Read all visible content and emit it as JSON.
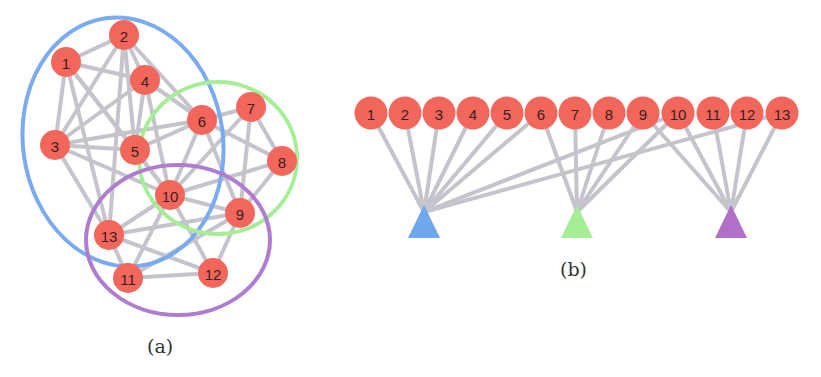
{
  "figure": {
    "panel_a": {
      "caption": "(a)",
      "nodes": [
        {
          "id": "1",
          "x": 66,
          "y": 62
        },
        {
          "id": "2",
          "x": 124,
          "y": 35
        },
        {
          "id": "3",
          "x": 55,
          "y": 145
        },
        {
          "id": "4",
          "x": 145,
          "y": 80
        },
        {
          "id": "5",
          "x": 135,
          "y": 150
        },
        {
          "id": "6",
          "x": 202,
          "y": 120
        },
        {
          "id": "7",
          "x": 251,
          "y": 107
        },
        {
          "id": "8",
          "x": 282,
          "y": 161
        },
        {
          "id": "9",
          "x": 240,
          "y": 213
        },
        {
          "id": "10",
          "x": 170,
          "y": 195
        },
        {
          "id": "11",
          "x": 128,
          "y": 278
        },
        {
          "id": "12",
          "x": 213,
          "y": 273
        },
        {
          "id": "13",
          "x": 109,
          "y": 235
        }
      ],
      "edges": [
        [
          "1",
          "2"
        ],
        [
          "1",
          "3"
        ],
        [
          "1",
          "4"
        ],
        [
          "1",
          "5"
        ],
        [
          "1",
          "13"
        ],
        [
          "1",
          "10"
        ],
        [
          "2",
          "3"
        ],
        [
          "2",
          "4"
        ],
        [
          "2",
          "5"
        ],
        [
          "2",
          "6"
        ],
        [
          "2",
          "13"
        ],
        [
          "3",
          "4"
        ],
        [
          "3",
          "5"
        ],
        [
          "3",
          "6"
        ],
        [
          "3",
          "10"
        ],
        [
          "3",
          "13"
        ],
        [
          "4",
          "5"
        ],
        [
          "4",
          "6"
        ],
        [
          "4",
          "10"
        ],
        [
          "5",
          "6"
        ],
        [
          "5",
          "10"
        ],
        [
          "6",
          "7"
        ],
        [
          "6",
          "9"
        ],
        [
          "6",
          "10"
        ],
        [
          "6",
          "8"
        ],
        [
          "7",
          "8"
        ],
        [
          "7",
          "9"
        ],
        [
          "7",
          "10"
        ],
        [
          "8",
          "9"
        ],
        [
          "8",
          "10"
        ],
        [
          "9",
          "10"
        ],
        [
          "9",
          "12"
        ],
        [
          "9",
          "13"
        ],
        [
          "9",
          "11"
        ],
        [
          "10",
          "11"
        ],
        [
          "10",
          "12"
        ],
        [
          "10",
          "13"
        ],
        [
          "11",
          "12"
        ],
        [
          "11",
          "13"
        ],
        [
          "12",
          "13"
        ]
      ],
      "communities": [
        {
          "name": "blue",
          "color": "#7aabf0",
          "cx": 123,
          "cy": 142,
          "rx": 100,
          "ry": 125,
          "rotate": -8
        },
        {
          "name": "green",
          "color": "#a6ee96",
          "cx": 218,
          "cy": 158,
          "rx": 79,
          "ry": 76,
          "rotate": 0
        },
        {
          "name": "purple",
          "color": "#b07cd0",
          "cx": 178,
          "cy": 240,
          "rx": 92,
          "ry": 75,
          "rotate": 0
        }
      ]
    },
    "panel_b": {
      "caption": "(b)",
      "node_y": 113,
      "nodes": [
        {
          "id": "1",
          "x": 371
        },
        {
          "id": "2",
          "x": 405
        },
        {
          "id": "3",
          "x": 439
        },
        {
          "id": "4",
          "x": 473
        },
        {
          "id": "5",
          "x": 507
        },
        {
          "id": "6",
          "x": 541
        },
        {
          "id": "7",
          "x": 575
        },
        {
          "id": "8",
          "x": 609
        },
        {
          "id": "9",
          "x": 643
        },
        {
          "id": "10",
          "x": 678
        },
        {
          "id": "11",
          "x": 713
        },
        {
          "id": "12",
          "x": 747
        },
        {
          "id": "13",
          "x": 782
        }
      ],
      "communities": [
        {
          "name": "blue",
          "color": "#6fa6ec",
          "x": 424,
          "members": [
            "1",
            "2",
            "3",
            "4",
            "5",
            "6",
            "10",
            "13"
          ]
        },
        {
          "name": "green",
          "color": "#a6ee96",
          "x": 577,
          "members": [
            "6",
            "7",
            "8",
            "9",
            "10"
          ]
        },
        {
          "name": "purple",
          "color": "#b070c8",
          "x": 731,
          "members": [
            "9",
            "10",
            "11",
            "12",
            "13"
          ]
        }
      ]
    }
  },
  "colors": {
    "node": "#f2665c",
    "edge": "#c4c4cc"
  }
}
